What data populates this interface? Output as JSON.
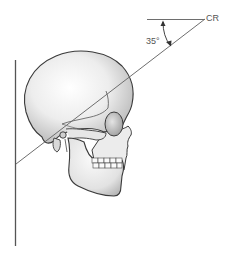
{
  "diagram": {
    "labels": {
      "central_ray": "CR",
      "angle": "35°"
    },
    "colors": {
      "line": "#6e6e6e",
      "outline": "#3a3a3a",
      "bone_light": "#f4f4f4",
      "bone_shade": "#bdbdbd",
      "text": "#555555"
    }
  }
}
